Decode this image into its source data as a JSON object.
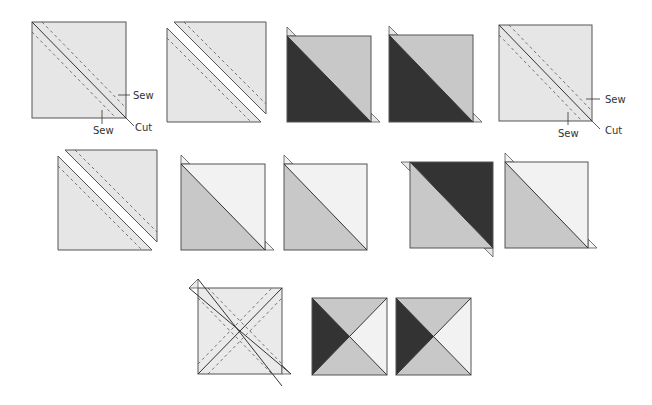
{
  "colors": {
    "light": "#e6e6e6",
    "lighter": "#f2f2f2",
    "medium": "#c8c8c8",
    "dark": "#333333",
    "outline": "#555555",
    "white": "#ffffff"
  },
  "labels": {
    "sew": "Sew",
    "cut": "Cut"
  },
  "rows": [
    {
      "name": "row-1",
      "steps": [
        {
          "name": "marked-square-1",
          "type": "marked"
        },
        {
          "name": "cut-square-1",
          "type": "cut-apart"
        },
        {
          "name": "hst-dark-1",
          "type": "hst",
          "fill_a": "dark",
          "fill_b": "medium"
        },
        {
          "name": "hst-dark-2",
          "type": "hst",
          "fill_a": "dark",
          "fill_b": "medium"
        },
        {
          "name": "marked-square-2",
          "type": "marked"
        }
      ]
    },
    {
      "name": "row-2",
      "steps": [
        {
          "name": "cut-square-2",
          "type": "cut-apart"
        },
        {
          "name": "hst-light-1",
          "type": "hst",
          "fill_a": "medium",
          "fill_b": "lighter"
        },
        {
          "name": "hst-light-2",
          "type": "hst",
          "fill_a": "medium",
          "fill_b": "lighter"
        },
        {
          "name": "hst-dark-mirror",
          "type": "hst-mirror",
          "fill_a": "medium",
          "fill_b": "dark"
        },
        {
          "name": "hst-light-3",
          "type": "hst",
          "fill_a": "medium",
          "fill_b": "lighter"
        }
      ]
    },
    {
      "name": "row-3",
      "steps": [
        {
          "name": "x-marked-square",
          "type": "x-marked"
        },
        {
          "name": "hourglass-1",
          "type": "hourglass"
        },
        {
          "name": "hourglass-2",
          "type": "hourglass"
        }
      ]
    }
  ]
}
